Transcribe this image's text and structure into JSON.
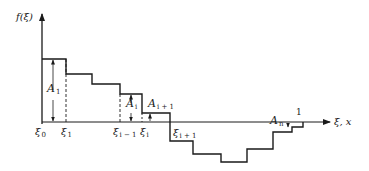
{
  "diagram": {
    "y_axis_label": "f(ξ)",
    "x_axis_label": "ξ, x",
    "colors": {
      "stroke": "#1a1a1a",
      "background": "#ffffff"
    },
    "x_ticks": [
      {
        "sym": "ξ",
        "sub": "0"
      },
      {
        "sym": "ξ",
        "sub": "1"
      },
      {
        "sym": "ξ",
        "sub": "i − 1"
      },
      {
        "sym": "ξ",
        "sub": "i"
      },
      {
        "sym": "ξ",
        "sub": "i + 1"
      }
    ],
    "areas": [
      {
        "sym": "A",
        "sub": "1"
      },
      {
        "sym": "A",
        "sub": "i"
      },
      {
        "sym": "A",
        "sub": "i + 1"
      },
      {
        "sym": "A",
        "sub": "n"
      }
    ],
    "unit_label": "1"
  }
}
